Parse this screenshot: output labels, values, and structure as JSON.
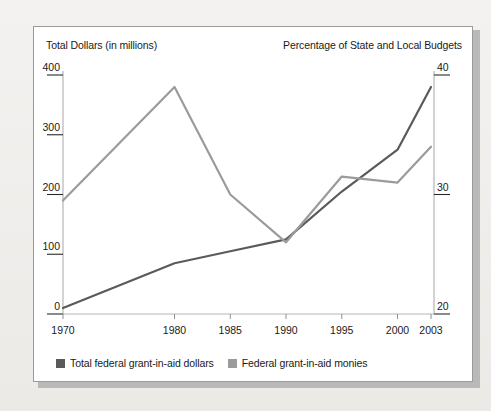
{
  "figure": {
    "background_color": "#efeeec",
    "panel_color": "#ffffff",
    "border_color": "#9a9a9a"
  },
  "chart_data": {
    "type": "line",
    "title": "",
    "left_axis_title": "Total Dollars (in millions)",
    "right_axis_title": "Percentage of State and Local Budgets",
    "xlabel": "",
    "categories": [
      "1970",
      "1980",
      "1985",
      "1990",
      "1995",
      "2000",
      "2003"
    ],
    "x_positions": [
      0,
      10,
      15,
      20,
      25,
      30,
      33
    ],
    "xlim": [
      0,
      33
    ],
    "left_ticks": [
      "0",
      "100",
      "200",
      "300",
      "400"
    ],
    "left_tick_values": [
      0,
      100,
      200,
      300,
      400
    ],
    "ylim": [
      0,
      400
    ],
    "ylabel": "Total Dollars (in millions)",
    "right_ticks": [
      "20",
      "30",
      "40"
    ],
    "right_tick_values": [
      20,
      30,
      40
    ],
    "right_ylim": [
      20,
      40
    ],
    "grid": false,
    "legend_position": "bottom-left",
    "series": [
      {
        "name": "Total federal grant-in-aid dollars",
        "axis": "left",
        "color": "#5a5a5a",
        "values": [
          10,
          85,
          105,
          125,
          205,
          275,
          380
        ]
      },
      {
        "name": "Federal grant-in-aid monies",
        "axis": "right",
        "color": "#9b9b9b",
        "values": [
          29.5,
          39.0,
          30.0,
          26.0,
          31.5,
          31.0,
          34.0
        ]
      }
    ]
  },
  "legend": {
    "items": [
      {
        "label": "Total federal grant-in-aid dollars",
        "color": "#5a5a5a"
      },
      {
        "label": "Federal grant-in-aid monies",
        "color": "#9b9b9b"
      }
    ]
  }
}
